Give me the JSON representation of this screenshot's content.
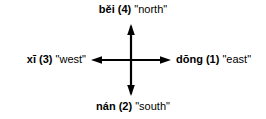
{
  "diagram": {
    "title_text": "",
    "background_color": "#ffffff",
    "stroke_color": "#000000",
    "directions": {
      "north": {
        "pinyin": "běi",
        "tone": "(4)",
        "gloss": "\"north\"",
        "arrow_icon": "arrow-up-icon"
      },
      "east": {
        "pinyin": "dōng",
        "tone": "(1)",
        "gloss": "\"east\"",
        "arrow_icon": "arrow-right-icon"
      },
      "south": {
        "pinyin": "nán",
        "tone": "(2)",
        "gloss": "\"south\"",
        "arrow_icon": "arrow-down-icon"
      },
      "west": {
        "pinyin": "xī",
        "tone": "(3)",
        "gloss": "\"west\"",
        "arrow_icon": "arrow-left-icon"
      }
    }
  }
}
